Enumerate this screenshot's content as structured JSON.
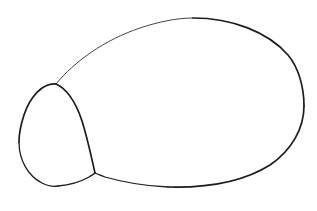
{
  "canvas": {
    "width": 317,
    "height": 211,
    "background_color": "#ffffff",
    "title": "two-overlapping-closed-curves-line-drawing",
    "description": "Black outline line drawing: a large tilted oval with a smaller teardrop/egg shape overlapping at its lower-left side"
  },
  "style": {
    "stroke_color": "#1c1c1c",
    "stroke_color_light": "#3a3a3a",
    "stroke_width_heavy": 1.7,
    "stroke_width_medium": 1.3,
    "stroke_width_light": 0.95
  },
  "shapes": [
    {
      "name": "large-oval",
      "label": "Large oval body",
      "kind": "closed-curve",
      "bounds": {
        "x_min": 56,
        "y_min": 18,
        "x_max": 304,
        "y_max": 187
      },
      "key_points": {
        "top": [
          193,
          18
        ],
        "right": [
          304,
          106
        ],
        "bottom": [
          168,
          187
        ],
        "upper_left_junction": [
          56,
          84
        ],
        "lower_junction": [
          95,
          173
        ]
      },
      "segments": [
        {
          "name": "oval-upper-left-thin",
          "weight": "light",
          "d": "M 56 84 C 74 62 104 40 140 28 C 158 22 176 18 193 18"
        },
        {
          "name": "oval-top-right-heavy",
          "weight": "heavy",
          "d": "M 193 18 C 232 18 268 32 288 55 C 299 68 304 88 304 106"
        },
        {
          "name": "oval-right-lower-heavy",
          "weight": "heavy",
          "d": "M 304 106 C 304 128 292 150 270 165 C 243 182 205 188 168 187"
        },
        {
          "name": "oval-bottom-left-medium",
          "weight": "medium",
          "d": "M 168 187 C 143 186 119 181 105 177 C 100 175 97 174 95 173"
        }
      ]
    },
    {
      "name": "small-teardrop",
      "label": "Small teardrop / egg shape",
      "kind": "closed-curve",
      "bounds": {
        "x_min": 19,
        "y_min": 83,
        "x_max": 95,
        "y_max": 187
      },
      "key_points": {
        "apex": [
          56,
          84
        ],
        "left": [
          19,
          142
        ],
        "bottom": [
          58,
          186
        ],
        "right_junction": [
          95,
          173
        ]
      },
      "segments": [
        {
          "name": "teardrop-left-heavy",
          "weight": "heavy",
          "d": "M 56 84 C 42 83 30 97 24 115 C 20 127 19 135 19 142"
        },
        {
          "name": "teardrop-bottom-left-medium",
          "weight": "medium",
          "d": "M 19 142 C 19 160 28 176 42 183 C 48 186 53 187 58 186"
        },
        {
          "name": "teardrop-bottom-right-medium",
          "weight": "medium",
          "d": "M 58 186 C 70 185 82 181 89 177 C 92 175 94 174 95 173"
        },
        {
          "name": "teardrop-right-heavy",
          "weight": "heavy",
          "d": "M 56 84 C 66 88 76 102 82 121 C 88 140 92 160 95 173"
        }
      ]
    }
  ]
}
